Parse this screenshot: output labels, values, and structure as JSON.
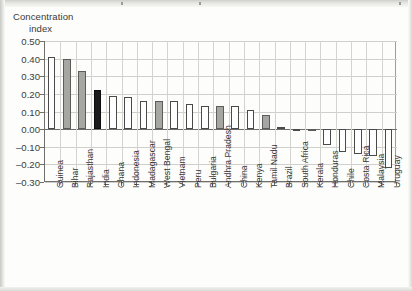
{
  "chart_data": {
    "type": "bar",
    "title": "Concentration index",
    "title_line1": "Concentration",
    "title_line2": "index",
    "xlabel": "",
    "ylabel": "Concentration index",
    "ylim": [
      -0.3,
      0.5
    ],
    "ytick_labels": [
      "0.50",
      "0.40",
      "0.30",
      "0.20",
      "0.10",
      "0.00",
      "-0.10",
      "-0.20",
      "-0.30"
    ],
    "ytick_values": [
      0.5,
      0.4,
      0.3,
      0.2,
      0.1,
      0.0,
      -0.1,
      -0.2,
      -0.3
    ],
    "grid": "both",
    "legend": "none",
    "categories": [
      "Guinea",
      "Bihar",
      "Rajasthan",
      "India",
      "Ghana",
      "Indonesia",
      "Madagascar",
      "West Bengal",
      "Vietnam",
      "Peru",
      "Bulgaria",
      "Andhra Pradesh",
      "China",
      "Kenya",
      "Tamil Nadu",
      "Brazil",
      "South Africa",
      "Kerala",
      "Honduras",
      "Chile",
      "Costa Rica",
      "Malaysia",
      "Uruguay"
    ],
    "values": [
      0.41,
      0.4,
      0.33,
      0.22,
      0.19,
      0.18,
      0.16,
      0.16,
      0.16,
      0.14,
      0.13,
      0.13,
      0.13,
      0.11,
      0.08,
      0.01,
      0.0,
      -0.01,
      -0.09,
      -0.13,
      -0.14,
      -0.15,
      -0.22
    ],
    "bar_styles": [
      "white",
      "gray",
      "gray",
      "black",
      "white",
      "white",
      "white",
      "gray",
      "white",
      "white",
      "white",
      "gray",
      "white",
      "white",
      "gray",
      "white",
      "white",
      "gray",
      "white",
      "white",
      "white",
      "white",
      "white"
    ],
    "style_legend": {
      "white": "country",
      "gray": "Indian state",
      "black": "India (national)"
    },
    "colors": {
      "bar_white": "#fefefe",
      "bar_gray": "#a6a6a2",
      "bar_black": "#1b1b1b",
      "bar_outline": "#4a4a48",
      "axis": "#6f6f6d",
      "grid": "#cfcfcc",
      "text": "#3a3a38",
      "page": "#fdfdfb"
    }
  }
}
